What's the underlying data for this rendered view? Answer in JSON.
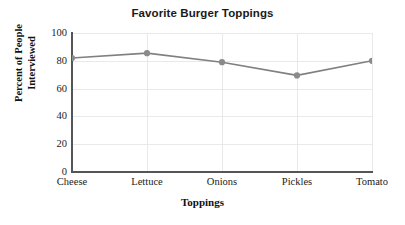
{
  "chart_data": {
    "type": "line",
    "title": "Favorite Burger Toppings",
    "xlabel": "Toppings",
    "ylabel": "Percent of People Interviewed",
    "ylabel_lines": [
      "Percent of People",
      "Interviewed"
    ],
    "categories": [
      "Cheese",
      "Lettuce",
      "Onions",
      "Pickles",
      "Tomato"
    ],
    "values": [
      82,
      85.5,
      79,
      69.5,
      80
    ],
    "ylim": [
      0,
      100
    ],
    "yticks": [
      0,
      20,
      40,
      60,
      80,
      100
    ],
    "ytick_labels": [
      "0",
      "20",
      "40",
      "60",
      "80",
      "100"
    ],
    "grid": true,
    "grid_axis": "both",
    "legend": false,
    "series_color": "#808080",
    "marker": "circle",
    "marker_color": "#8a8a8a",
    "grid_color": "#e9e9e9",
    "axis_color": "#555555",
    "text_color": "#1a1a1a",
    "background": "#ffffff"
  }
}
